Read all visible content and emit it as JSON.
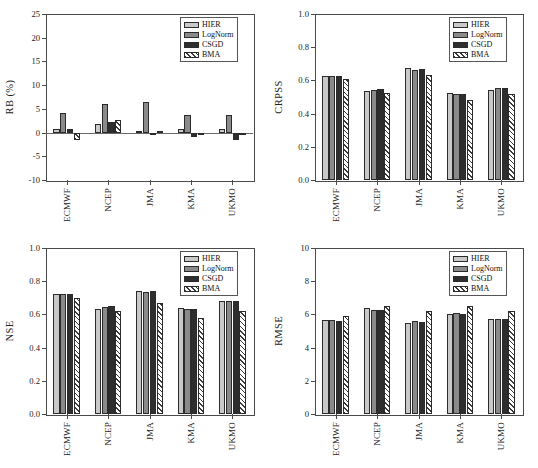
{
  "figure": {
    "categories": [
      "ECMWF",
      "NCEP",
      "JMA",
      "KMA",
      "UKMO"
    ],
    "series_names": [
      "HIER",
      "LogNorm",
      "CSGD",
      "BMA"
    ],
    "colors": {
      "HIER": "#c9c9c9",
      "LogNorm": "#8a8a8a",
      "CSGD": "#2e2e2e",
      "BMA": "#ffffff",
      "axis": "#4a4a4a",
      "text": "#1a1a1a"
    }
  },
  "panels": [
    {
      "id": "rb",
      "ylabel": "RB (%)",
      "yticks": [
        "25",
        "20",
        "15",
        "10",
        "5",
        "0",
        "-5",
        "-10"
      ],
      "ymin": -10,
      "ymax": 25,
      "legend": [
        "HIER",
        "LogNorm",
        "CSGD",
        "BMA"
      ]
    },
    {
      "id": "crpss",
      "ylabel": "CRPSS",
      "yticks": [
        "1.0",
        "0.8",
        "0.6",
        "0.4",
        "0.2",
        "0.0"
      ],
      "ymin": 0,
      "ymax": 1.0,
      "legend": [
        "HIER",
        "LogNorm",
        "CSGD",
        "BMA"
      ]
    },
    {
      "id": "nse",
      "ylabel": "NSE",
      "yticks": [
        "1.0",
        "0.8",
        "0.6",
        "0.4",
        "0.2",
        "0.0"
      ],
      "ymin": 0,
      "ymax": 1.0,
      "legend": [
        "HIER",
        "LogNorm",
        "CSGD",
        "BMA"
      ]
    },
    {
      "id": "rmse",
      "ylabel": "RMSE",
      "yticks": [
        "10",
        "8",
        "6",
        "4",
        "2",
        "0"
      ],
      "ymin": 0,
      "ymax": 10,
      "legend": [
        "HIER",
        "LogNorm",
        "CSGD",
        "BMA"
      ]
    }
  ],
  "chart_data": [
    {
      "type": "bar",
      "title": "",
      "xlabel": "",
      "ylabel": "RB (%)",
      "ylim": [
        -10,
        25
      ],
      "ytick_values": [
        -10,
        -5,
        0,
        5,
        10,
        15,
        20,
        25
      ],
      "grid": false,
      "legend_position": "top-right",
      "categories": [
        "ECMWF",
        "NCEP",
        "JMA",
        "KMA",
        "UKMO"
      ],
      "series": [
        {
          "name": "HIER",
          "values": [
            0.7,
            1.9,
            0.4,
            0.7,
            0.7
          ]
        },
        {
          "name": "LogNorm",
          "values": [
            4.2,
            6.0,
            6.4,
            3.8,
            3.7
          ]
        },
        {
          "name": "CSGD",
          "values": [
            0.7,
            2.2,
            -0.5,
            -0.9,
            -1.5
          ]
        },
        {
          "name": "BMA",
          "values": [
            -1.5,
            2.6,
            0.4,
            -0.5,
            -0.3
          ]
        }
      ]
    },
    {
      "type": "bar",
      "title": "",
      "xlabel": "",
      "ylabel": "CRPSS",
      "ylim": [
        0,
        1.0
      ],
      "ytick_values": [
        0.0,
        0.2,
        0.4,
        0.6,
        0.8,
        1.0
      ],
      "grid": false,
      "legend_position": "top-right",
      "categories": [
        "ECMWF",
        "NCEP",
        "JMA",
        "KMA",
        "UKMO"
      ],
      "series": [
        {
          "name": "HIER",
          "values": [
            0.625,
            0.537,
            0.672,
            0.524,
            0.545
          ]
        },
        {
          "name": "LogNorm",
          "values": [
            0.626,
            0.545,
            0.665,
            0.519,
            0.553
          ]
        },
        {
          "name": "CSGD",
          "values": [
            0.628,
            0.547,
            0.668,
            0.517,
            0.553
          ]
        },
        {
          "name": "BMA",
          "values": [
            0.607,
            0.524,
            0.634,
            0.484,
            0.518
          ]
        }
      ]
    },
    {
      "type": "bar",
      "title": "",
      "xlabel": "",
      "ylabel": "NSE",
      "ylim": [
        0,
        1.0
      ],
      "ytick_values": [
        0.0,
        0.2,
        0.4,
        0.6,
        0.8,
        1.0
      ],
      "grid": false,
      "legend_position": "top-right",
      "categories": [
        "ECMWF",
        "NCEP",
        "JMA",
        "KMA",
        "UKMO"
      ],
      "series": [
        {
          "name": "HIER",
          "values": [
            0.721,
            0.634,
            0.738,
            0.636,
            0.681
          ]
        },
        {
          "name": "LogNorm",
          "values": [
            0.722,
            0.645,
            0.734,
            0.633,
            0.679
          ]
        },
        {
          "name": "CSGD",
          "values": [
            0.722,
            0.651,
            0.738,
            0.635,
            0.681
          ]
        },
        {
          "name": "BMA",
          "values": [
            0.699,
            0.622,
            0.667,
            0.578,
            0.62
          ]
        }
      ]
    },
    {
      "type": "bar",
      "title": "",
      "xlabel": "",
      "ylabel": "RMSE",
      "ylim": [
        0,
        10
      ],
      "ytick_values": [
        0,
        2,
        4,
        6,
        8,
        10
      ],
      "grid": false,
      "legend_position": "top-right",
      "categories": [
        "ECMWF",
        "NCEP",
        "JMA",
        "KMA",
        "UKMO"
      ],
      "series": [
        {
          "name": "HIER",
          "values": [
            5.65,
            6.4,
            5.5,
            6.05,
            5.75
          ]
        },
        {
          "name": "LogNorm",
          "values": [
            5.68,
            6.28,
            5.62,
            6.07,
            5.72
          ]
        },
        {
          "name": "CSGD",
          "values": [
            5.62,
            6.25,
            5.52,
            6.02,
            5.7
          ]
        },
        {
          "name": "BMA",
          "values": [
            5.88,
            6.52,
            6.22,
            6.48,
            6.22
          ]
        }
      ]
    }
  ]
}
